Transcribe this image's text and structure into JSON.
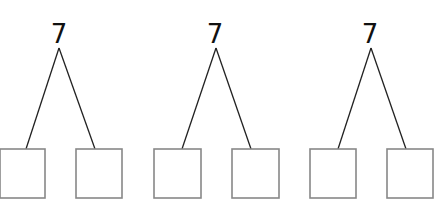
{
  "bonds": [
    {
      "whole": "7",
      "parts": [
        "",
        ""
      ]
    },
    {
      "whole": "7",
      "parts": [
        "",
        ""
      ]
    },
    {
      "whole": "7",
      "parts": [
        "",
        ""
      ]
    }
  ],
  "colors": {
    "line": "#222222",
    "box_border": "#888888",
    "text": "#111111"
  }
}
